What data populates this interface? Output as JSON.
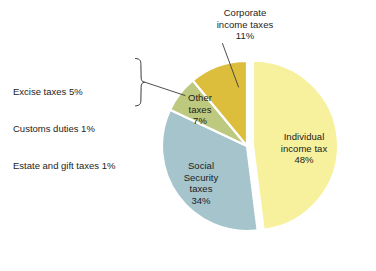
{
  "chart_data": {
    "type": "pie",
    "title": "",
    "subtitle": "",
    "xlabel": "",
    "ylabel": "",
    "legend_position": "none",
    "grid": false,
    "units": "percent",
    "categories": [
      "Individual income tax",
      "Social Security taxes",
      "Other taxes",
      "Corporate income taxes"
    ],
    "values": [
      48,
      34,
      7,
      11
    ],
    "slices": [
      {
        "name": "Individual income tax",
        "value": 48,
        "value_label": "48%",
        "color": "#F7F09C",
        "exploded": true,
        "label_lines": [
          "Individual",
          "income tax",
          "48%"
        ]
      },
      {
        "name": "Social Security taxes",
        "value": 34,
        "value_label": "34%",
        "color": "#A5C4CC",
        "exploded": false,
        "label_lines": [
          "Social",
          "Security",
          "taxes",
          "34%"
        ]
      },
      {
        "name": "Other taxes",
        "value": 7,
        "value_label": "7%",
        "color": "#BCC97E",
        "exploded": false,
        "label_lines": [
          "Other",
          "taxes",
          "7%"
        ]
      },
      {
        "name": "Corporate income taxes",
        "value": 11,
        "value_label": "11%",
        "color": "#DCBE3C",
        "exploded": false,
        "label_lines": [
          "Corporate",
          "income taxes",
          "11%"
        ]
      }
    ],
    "breakdown": {
      "of_slice": "Other taxes",
      "items": [
        {
          "label": "Excise taxes",
          "value": 5,
          "text": "Excise taxes 5%"
        },
        {
          "label": "Customs duties",
          "value": 1,
          "text": "Customs duties 1%"
        },
        {
          "label": "Estate and gift taxes",
          "value": 1,
          "text": "Estate and gift taxes 1%"
        }
      ]
    }
  },
  "labels": {
    "individual": "Individual\nincome tax\n48%",
    "social": "Social\nSecurity\ntaxes\n34%",
    "other": "Other\ntaxes\n7%",
    "corporate": "Corporate\nincome taxes\n11%"
  },
  "annotation": {
    "line1": "Excise taxes 5%",
    "line2": "Customs duties 1%",
    "line3": "Estate and gift taxes 1%"
  },
  "colors": {
    "individual": "#F7F09C",
    "social": "#A5C4CC",
    "other": "#BCC97E",
    "corporate": "#DCBE3C",
    "slice_border": "#ffffff",
    "text": "#1c1c1c",
    "leader_line": "#3a3a3a",
    "background": "#ffffff"
  }
}
